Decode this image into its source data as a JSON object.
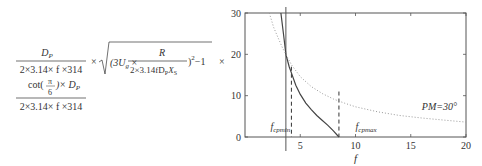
{
  "formula": {
    "line1": {
      "frac1_num": "D",
      "frac1_num_sub": "P",
      "frac1_den": "2×3.14× f ×314",
      "times": "×",
      "sqrt_open": "(3U",
      "sqrt_open_sub": "g",
      "sqrt_times": " × ",
      "inner_num": "R",
      "inner_den": "2×3.14fD",
      "inner_den_sub1": "P",
      "inner_den_mid": "X",
      "inner_den_sub2": "S",
      "sqrt_close": ")",
      "sqrt_exp": "2",
      "sqrt_tail": "−1",
      "trailing_times": "×"
    },
    "line2": {
      "num_pre": "cot(",
      "pi_num": "π",
      "pi_den": "6",
      "num_post": ")× D",
      "num_sub": "P",
      "den": "2×3.14× f ×314"
    }
  },
  "chart_data": {
    "type": "line",
    "title": "",
    "xlabel": "f",
    "ylabel": "",
    "xlim": [
      0,
      20
    ],
    "ylim": [
      0,
      30
    ],
    "x_ticks": [
      5,
      10,
      15,
      20
    ],
    "y_ticks": [
      0,
      10,
      20,
      30
    ],
    "x_tick_labels": [
      "5",
      "10",
      "15",
      "20"
    ],
    "y_tick_labels": [
      "0",
      "10",
      "20",
      "30"
    ],
    "grid": false,
    "series": [
      {
        "name": "constraint curve (solid)",
        "style": "solid",
        "x": [
          3.25,
          3.5,
          3.7,
          4.0,
          4.2,
          4.6,
          5.0,
          5.5,
          6.0,
          6.5,
          7.0,
          7.5,
          8.0,
          8.5
        ],
        "y": [
          30,
          24.5,
          20,
          17,
          15.5,
          12.5,
          10.3,
          8.2,
          6.6,
          5.2,
          4.0,
          2.8,
          1.5,
          0
        ]
      },
      {
        "name": "PM=30°",
        "style": "dotted",
        "x": [
          2.2,
          2.6,
          3.0,
          3.4,
          3.7,
          4.2,
          5.0,
          6.0,
          7.0,
          8.0,
          9.0,
          10.0,
          12.0,
          14.0,
          16.0,
          18.0,
          20.0
        ],
        "y": [
          30,
          26.5,
          24,
          21.5,
          20,
          17.5,
          14.6,
          12.2,
          10.5,
          9.2,
          8.2,
          7.3,
          6.1,
          5.2,
          4.6,
          4.1,
          3.6
        ]
      }
    ],
    "vertical_lines": [
      {
        "x": 3.7,
        "style": "solid",
        "label": ""
      },
      {
        "x": 4.2,
        "style": "dashed",
        "y_top": 17
      },
      {
        "x": 8.5,
        "style": "dashed",
        "y_top": 11
      }
    ],
    "annotations": [
      {
        "text": "f",
        "sub": "cpmin",
        "x": 2.3,
        "y": 1.8
      },
      {
        "text": "f",
        "sub": "cpmax",
        "x": 10.0,
        "y": 1.8
      },
      {
        "text": "PM=30°",
        "x": 16.0,
        "y": 6.5
      }
    ]
  }
}
